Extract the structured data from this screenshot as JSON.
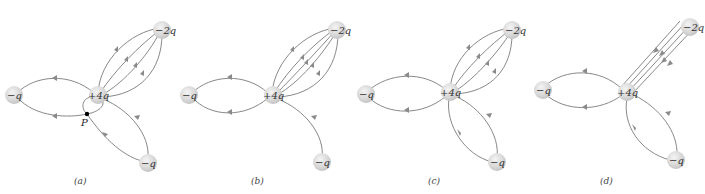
{
  "figure": {
    "header_fragment": "",
    "panels": [
      {
        "id": "a",
        "label": "(a)",
        "charges": {
          "center": "+4q",
          "upper_right": "−2q",
          "left": "−q",
          "lower_right": "−q"
        },
        "point_label": "P",
        "description": "Four curved field lines from +4q to −2q; two to left −q; one line to lower −q passing through point P and looping back to +4q"
      },
      {
        "id": "b",
        "label": "(b)",
        "charges": {
          "center": "+4q",
          "upper_right": "−2q",
          "left": "−q",
          "lower_right": "−q"
        },
        "description": "Five curved field lines from +4q to −2q; two to left −q; one to lower −q"
      },
      {
        "id": "c",
        "label": "(c)",
        "charges": {
          "center": "+4q",
          "upper_right": "−2q",
          "left": "−q",
          "lower_right": "−q"
        },
        "description": "Four curved field lines from +4q to −2q; two to left −q; two to lower −q"
      },
      {
        "id": "d",
        "label": "(d)",
        "charges": {
          "center": "+4q",
          "upper_right": "−2q",
          "left": "−q",
          "lower_right": "−q"
        },
        "description": "Four straight parallel field lines from +4q to −2q; two to left −q; two to lower −q"
      }
    ]
  },
  "colors": {
    "field_line": "#7a7a7a",
    "charge_fill": "#d9d9d9",
    "charge_highlight": "#f2f2f2",
    "text": "#333333",
    "point": "#000000"
  }
}
